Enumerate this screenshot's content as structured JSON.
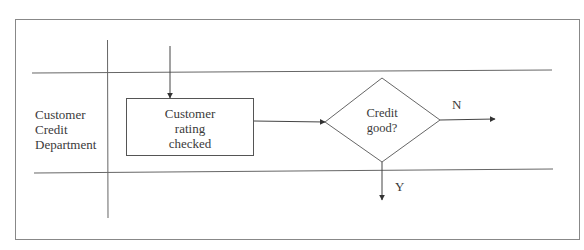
{
  "diagram": {
    "swimlane": {
      "label_lines": [
        "Customer",
        "Credit",
        "Department"
      ]
    },
    "process_box": {
      "label_lines": [
        "Customer",
        "rating",
        "checked"
      ]
    },
    "decision": {
      "label_lines": [
        "Credit",
        "good?"
      ]
    },
    "branches": {
      "no_label": "N",
      "yes_label": "Y"
    },
    "colors": {
      "line": "#555555",
      "frame": "#777777",
      "text": "#3a3a3a"
    }
  }
}
